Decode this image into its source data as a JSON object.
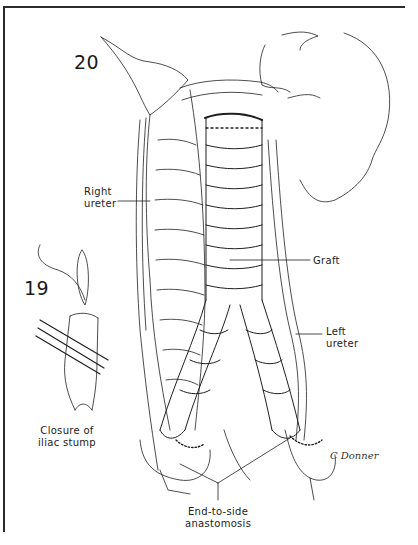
{
  "figure": {
    "figure_20_number": "20",
    "figure_19_number": "19",
    "labels": {
      "right_ureter": [
        "Right",
        "ureter"
      ],
      "graft": "Graft",
      "left_ureter": [
        "Left",
        "ureter"
      ],
      "closure": [
        "Closure of",
        "iliac stump"
      ],
      "anastomosis": [
        "End-to-side",
        "anastomosis"
      ]
    },
    "signature": "C Donner"
  },
  "colors": {
    "ink": "#1a1a1a",
    "background": "#ffffff"
  }
}
